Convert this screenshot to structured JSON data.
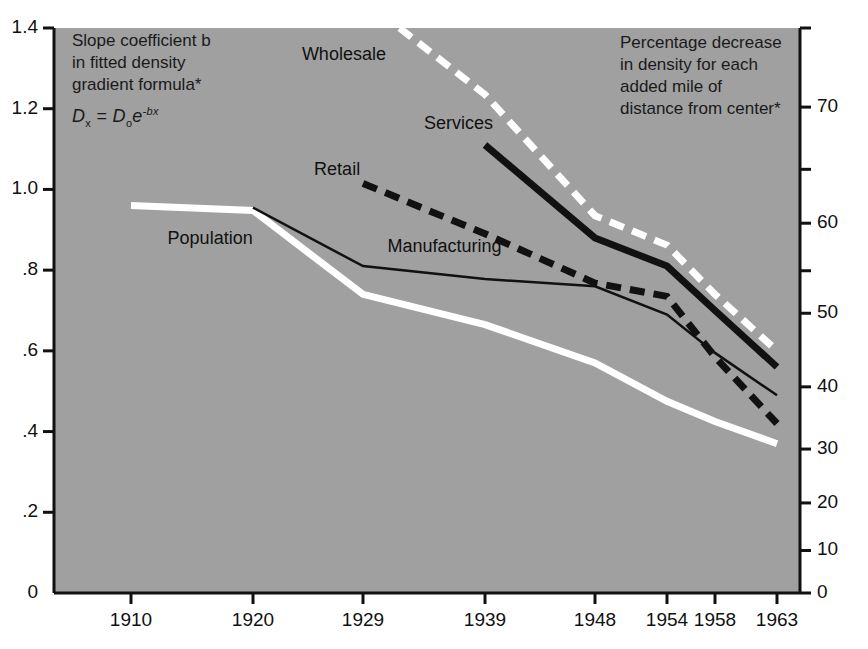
{
  "figure": {
    "top_ghost_text": "",
    "background_color": "#a0a0a0",
    "page_color": "#ffffff"
  },
  "annotations": {
    "left_note": {
      "line1": "Slope coefficient b",
      "line2": "in fitted density",
      "line3": "gradient formula*",
      "formula_lhs": "D",
      "formula_lhs_sub": "x",
      "formula_eq": "=",
      "formula_rhs": "D",
      "formula_rhs_sub": "o",
      "formula_exp_base": "e",
      "formula_exp": "-bx"
    },
    "right_note": {
      "line1": "Percentage decrease",
      "line2": "in density for each",
      "line3": "added mile of",
      "line4": "distance from center*"
    }
  },
  "chart_data": {
    "type": "line",
    "title": "",
    "subtitle": "",
    "xlabel": "",
    "ylabel": "Slope coefficient b in fitted density gradient formula*",
    "ylabel_right": "Percentage decrease in density for each added mile of distance from center*",
    "grid": false,
    "legend": "inline-labels",
    "x": [
      1910,
      1920,
      1929,
      1939,
      1948,
      1954,
      1958,
      1963
    ],
    "xtick_labels": [
      "1910",
      "1920",
      "1929",
      "1939",
      "1948",
      "1954",
      "1958",
      "1963"
    ],
    "ylim": [
      0,
      1.4
    ],
    "ytick_values": [
      0,
      0.2,
      0.4,
      0.6,
      0.8,
      1.0,
      1.2,
      1.4
    ],
    "ytick_labels": [
      "0",
      ".2",
      ".4",
      ".6",
      ".8",
      "1.0",
      "1.2",
      "1.4"
    ],
    "right_axis": {
      "label_formula": "100 * (1 - exp(-b))",
      "ylim": [
        0,
        75.3
      ],
      "ticks": [
        {
          "value": 75.3,
          "label": ""
        },
        {
          "value": 70,
          "label": "70"
        },
        {
          "value": 65,
          "label": ""
        },
        {
          "value": 60,
          "label": "60"
        },
        {
          "value": 55,
          "label": ""
        },
        {
          "value": 50,
          "label": "50"
        },
        {
          "value": 40,
          "label": "40"
        },
        {
          "value": 30,
          "label": "30"
        },
        {
          "value": 20,
          "label": "20"
        },
        {
          "value": 10,
          "label": "10"
        },
        {
          "value": 0,
          "label": "0"
        }
      ]
    },
    "series": [
      {
        "name": "Population",
        "style": "solid-thick-white",
        "color": "#ffffff",
        "label_x": 1913,
        "label_y": 0.875,
        "points": [
          {
            "x": 1910,
            "y": 0.96
          },
          {
            "x": 1920,
            "y": 0.948
          },
          {
            "x": 1929,
            "y": 0.74
          },
          {
            "x": 1939,
            "y": 0.665
          },
          {
            "x": 1948,
            "y": 0.57
          },
          {
            "x": 1954,
            "y": 0.475
          },
          {
            "x": 1958,
            "y": 0.425
          },
          {
            "x": 1963,
            "y": 0.37
          }
        ]
      },
      {
        "name": "Manufacturing",
        "style": "solid-thin-black",
        "color": "#111111",
        "label_x": 1931,
        "label_y": 0.855,
        "points": [
          {
            "x": 1920,
            "y": 0.955
          },
          {
            "x": 1929,
            "y": 0.81
          },
          {
            "x": 1939,
            "y": 0.778
          },
          {
            "x": 1948,
            "y": 0.76
          },
          {
            "x": 1954,
            "y": 0.69
          },
          {
            "x": 1958,
            "y": 0.595
          },
          {
            "x": 1963,
            "y": 0.49
          }
        ]
      },
      {
        "name": "Retail",
        "style": "dashed-thick-black",
        "color": "#111111",
        "label_x": 1925,
        "label_y": 1.045,
        "points": [
          {
            "x": 1929,
            "y": 1.015
          },
          {
            "x": 1939,
            "y": 0.89
          },
          {
            "x": 1948,
            "y": 0.768
          },
          {
            "x": 1954,
            "y": 0.735
          },
          {
            "x": 1958,
            "y": 0.585
          },
          {
            "x": 1963,
            "y": 0.42
          }
        ]
      },
      {
        "name": "Services",
        "style": "solid-thick-black",
        "color": "#111111",
        "label_x": 1934,
        "label_y": 1.16,
        "points": [
          {
            "x": 1939,
            "y": 1.11
          },
          {
            "x": 1948,
            "y": 0.88
          },
          {
            "x": 1954,
            "y": 0.81
          },
          {
            "x": 1958,
            "y": 0.7
          },
          {
            "x": 1963,
            "y": 0.56
          }
        ]
      },
      {
        "name": "Wholesale",
        "style": "dashed-thick-white",
        "color": "#ffffff",
        "label_x": 1924,
        "label_y": 1.33,
        "points": [
          {
            "x": 1932,
            "y": 1.4
          },
          {
            "x": 1939,
            "y": 1.235
          },
          {
            "x": 1948,
            "y": 0.935
          },
          {
            "x": 1954,
            "y": 0.862
          },
          {
            "x": 1958,
            "y": 0.74
          },
          {
            "x": 1963,
            "y": 0.6
          }
        ]
      }
    ]
  }
}
